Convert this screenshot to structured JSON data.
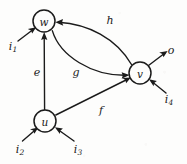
{
  "figure": {
    "background_color": "#fdfdfc",
    "ink_color": "#1b1b1b"
  },
  "nodes": [
    {
      "id": "w",
      "label": "w",
      "cx": 44,
      "cy": 21,
      "r": 11
    },
    {
      "id": "v",
      "label": "v",
      "cx": 140,
      "cy": 73,
      "r": 11
    },
    {
      "id": "u",
      "label": "u",
      "cx": 45,
      "cy": 121,
      "r": 11
    }
  ],
  "edges": [
    {
      "id": "e",
      "label": "e",
      "from": "u",
      "to": "w",
      "label_x": 37,
      "label_y": 72,
      "shape": "straight"
    },
    {
      "id": "f",
      "label": "f",
      "from": "u",
      "to": "v",
      "label_x": 101,
      "label_y": 110,
      "shape": "straight"
    },
    {
      "id": "g",
      "label": "g",
      "from": "w",
      "to": "v",
      "label_x": 76,
      "label_y": 72,
      "shape": "curved-lower"
    },
    {
      "id": "h",
      "label": "h",
      "from": "v",
      "to": "w",
      "label_x": 110,
      "label_y": 20,
      "shape": "curved-upper"
    }
  ],
  "inputs": [
    {
      "id": "i1",
      "base": "i",
      "sub": "1",
      "target": "w",
      "label_x": 13,
      "label_y": 46
    },
    {
      "id": "i2",
      "base": "i",
      "sub": "2",
      "target": "u",
      "label_x": 20,
      "label_y": 149
    },
    {
      "id": "i3",
      "base": "i",
      "sub": "3",
      "target": "u",
      "label_x": 78,
      "label_y": 149
    },
    {
      "id": "i4",
      "base": "i",
      "sub": "4",
      "target": "v",
      "label_x": 169,
      "label_y": 99
    }
  ],
  "outputs": [
    {
      "id": "o",
      "label": "o",
      "source": "v",
      "label_x": 171,
      "label_y": 50
    }
  ]
}
